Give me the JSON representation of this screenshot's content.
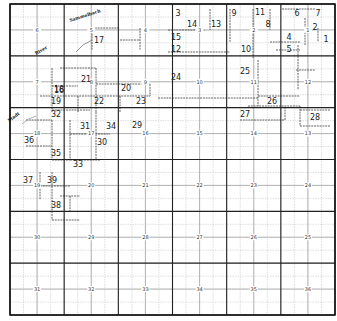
{
  "map": {
    "grid": {
      "left": 10,
      "top": 4,
      "right": 335,
      "bottom": 315,
      "cols": 6,
      "rows": 6,
      "subdivisions": 4,
      "colors": {
        "major": "#222222",
        "minor": "#bdbdbd",
        "border": "#111111",
        "lot_line": "#555555"
      }
    },
    "sections": [
      {
        "n": "6",
        "col": 0,
        "row": 0
      },
      {
        "n": "5",
        "col": 1,
        "row": 0
      },
      {
        "n": "4",
        "col": 2,
        "row": 0
      },
      {
        "n": "3",
        "col": 3,
        "row": 0
      },
      {
        "n": "2",
        "col": 4,
        "row": 0
      },
      {
        "n": "1",
        "col": 5,
        "row": 0
      },
      {
        "n": "7",
        "col": 0,
        "row": 1
      },
      {
        "n": "8",
        "col": 1,
        "row": 1
      },
      {
        "n": "9",
        "col": 2,
        "row": 1
      },
      {
        "n": "10",
        "col": 3,
        "row": 1
      },
      {
        "n": "11",
        "col": 4,
        "row": 1
      },
      {
        "n": "12",
        "col": 5,
        "row": 1
      },
      {
        "n": "18",
        "col": 0,
        "row": 2
      },
      {
        "n": "17",
        "col": 1,
        "row": 2
      },
      {
        "n": "16",
        "col": 2,
        "row": 2
      },
      {
        "n": "15",
        "col": 3,
        "row": 2
      },
      {
        "n": "14",
        "col": 4,
        "row": 2
      },
      {
        "n": "13",
        "col": 5,
        "row": 2
      },
      {
        "n": "19",
        "col": 0,
        "row": 3
      },
      {
        "n": "20",
        "col": 1,
        "row": 3
      },
      {
        "n": "21",
        "col": 2,
        "row": 3
      },
      {
        "n": "22",
        "col": 3,
        "row": 3
      },
      {
        "n": "23",
        "col": 4,
        "row": 3
      },
      {
        "n": "24",
        "col": 5,
        "row": 3
      },
      {
        "n": "30",
        "col": 0,
        "row": 4
      },
      {
        "n": "29",
        "col": 1,
        "row": 4
      },
      {
        "n": "28",
        "col": 2,
        "row": 4
      },
      {
        "n": "27",
        "col": 3,
        "row": 4
      },
      {
        "n": "26",
        "col": 4,
        "row": 4
      },
      {
        "n": "25",
        "col": 5,
        "row": 4
      },
      {
        "n": "31",
        "col": 0,
        "row": 5
      },
      {
        "n": "32",
        "col": 1,
        "row": 5
      },
      {
        "n": "33",
        "col": 2,
        "row": 5
      },
      {
        "n": "34",
        "col": 3,
        "row": 5
      },
      {
        "n": "35",
        "col": 4,
        "row": 5
      },
      {
        "n": "36",
        "col": 5,
        "row": 5
      }
    ],
    "lots": [
      {
        "n": "1",
        "x": 326,
        "y": 39
      },
      {
        "n": "2",
        "x": 315,
        "y": 27
      },
      {
        "n": "3",
        "x": 178,
        "y": 13
      },
      {
        "n": "4",
        "x": 289,
        "y": 37
      },
      {
        "n": "5",
        "x": 289,
        "y": 49
      },
      {
        "n": "6",
        "x": 297,
        "y": 13
      },
      {
        "n": "7",
        "x": 318,
        "y": 13
      },
      {
        "n": "8",
        "x": 268,
        "y": 24
      },
      {
        "n": "9",
        "x": 234,
        "y": 13
      },
      {
        "n": "10",
        "x": 246,
        "y": 49
      },
      {
        "n": "11",
        "x": 260,
        "y": 12
      },
      {
        "n": "12",
        "x": 176,
        "y": 49
      },
      {
        "n": "13",
        "x": 216,
        "y": 24
      },
      {
        "n": "14",
        "x": 192,
        "y": 24
      },
      {
        "n": "15",
        "x": 176,
        "y": 37
      },
      {
        "n": "16",
        "x": 59,
        "y": 90
      },
      {
        "n": "17",
        "x": 99,
        "y": 40
      },
      {
        "n": "18",
        "x": 59,
        "y": 89
      },
      {
        "n": "19",
        "x": 56,
        "y": 101
      },
      {
        "n": "20",
        "x": 126,
        "y": 88
      },
      {
        "n": "21",
        "x": 86,
        "y": 79
      },
      {
        "n": "22",
        "x": 99,
        "y": 101
      },
      {
        "n": "23",
        "x": 141,
        "y": 101
      },
      {
        "n": "24",
        "x": 176,
        "y": 77
      },
      {
        "n": "25",
        "x": 245,
        "y": 71
      },
      {
        "n": "26",
        "x": 272,
        "y": 101
      },
      {
        "n": "27",
        "x": 245,
        "y": 114
      },
      {
        "n": "28",
        "x": 315,
        "y": 117
      },
      {
        "n": "29",
        "x": 137,
        "y": 125
      },
      {
        "n": "30",
        "x": 102,
        "y": 142
      },
      {
        "n": "31",
        "x": 85,
        "y": 126
      },
      {
        "n": "32",
        "x": 56,
        "y": 114
      },
      {
        "n": "33",
        "x": 78,
        "y": 164
      },
      {
        "n": "34",
        "x": 111,
        "y": 126
      },
      {
        "n": "35",
        "x": 56,
        "y": 153
      },
      {
        "n": "36",
        "x": 29,
        "y": 140
      },
      {
        "n": "37",
        "x": 28,
        "y": 180
      },
      {
        "n": "38",
        "x": 56,
        "y": 205
      },
      {
        "n": "39",
        "x": 52,
        "y": 180
      }
    ],
    "water_labels": [
      {
        "text": "Sammelbach",
        "x": 70,
        "y": 22,
        "angle": -18
      },
      {
        "text": "River",
        "x": 36,
        "y": 55,
        "angle": -30
      },
      {
        "text": "Stadt",
        "x": 9,
        "y": 122,
        "angle": -35
      }
    ]
  }
}
